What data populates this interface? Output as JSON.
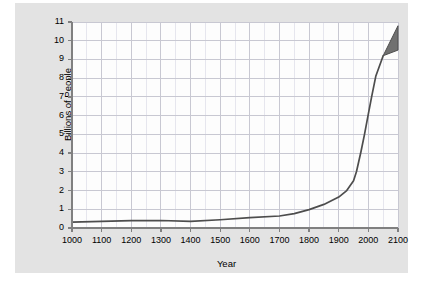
{
  "chart_data": {
    "type": "line",
    "title": "",
    "xlabel": "Year",
    "ylabel": "Billions of People",
    "xlim": [
      1000,
      2100
    ],
    "ylim": [
      0,
      11
    ],
    "xticks": [
      1000,
      1100,
      1200,
      1300,
      1400,
      1500,
      1600,
      1700,
      1800,
      1900,
      2000,
      2100
    ],
    "yticks": [
      0,
      1,
      2,
      3,
      4,
      5,
      6,
      7,
      8,
      9,
      10,
      11
    ],
    "grid": true,
    "grid_minor_x_step": 50,
    "legend": "none",
    "series": [
      {
        "name": "World population",
        "x": [
          1000,
          1100,
          1200,
          1300,
          1400,
          1500,
          1600,
          1700,
          1750,
          1800,
          1850,
          1900,
          1927,
          1950,
          1960,
          1975,
          1987,
          2000,
          2011,
          2025,
          2050
        ],
        "values": [
          0.31,
          0.35,
          0.39,
          0.4,
          0.35,
          0.44,
          0.55,
          0.64,
          0.77,
          0.98,
          1.26,
          1.65,
          2.0,
          2.52,
          3.02,
          4.07,
          5.0,
          6.09,
          7.0,
          8.1,
          9.2
        ]
      }
    ],
    "projection_cone": {
      "apex_x": 2050,
      "apex_y": 9.2,
      "high_x": 2100,
      "high_y": 10.8,
      "low_x": 2100,
      "low_y": 9.5,
      "fill": "#707070"
    },
    "colors": {
      "line": "#4d4d4d",
      "plot_background": "#fdfdfd",
      "panel_background": "#e3e3e3",
      "grid_major": "#c8c8d2",
      "grid_minor": "#e6e6ee",
      "axis": "#808080",
      "text": "#000000"
    }
  }
}
